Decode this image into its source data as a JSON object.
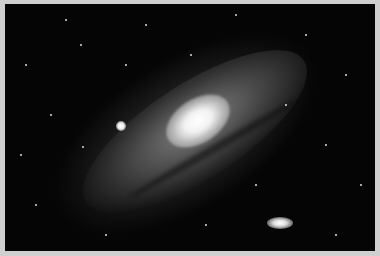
{
  "image": {
    "subject": "Andromeda galaxy with satellite galaxies in a starfield",
    "colors": {
      "border": "#cfcfcf",
      "sky": "#050505",
      "core": "#ffffff"
    }
  }
}
